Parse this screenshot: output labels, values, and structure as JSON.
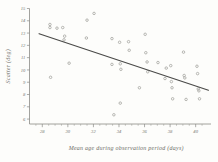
{
  "chart_data": {
    "type": "scatter",
    "title": "",
    "xlabel": "Mean age during observation period  (days)",
    "ylabel": "Scatter (deg)",
    "xlim": [
      27.0,
      41.2
    ],
    "ylim": [
      5.6,
      15.0
    ],
    "grid": false,
    "legend": null,
    "xticks": [
      28,
      30,
      32,
      34,
      36,
      38,
      40
    ],
    "xtick_labels": [
      "28",
      "30",
      "32",
      "34",
      "36",
      "38",
      "40"
    ],
    "yticks": [
      6,
      7,
      8,
      9,
      10,
      11,
      12,
      13,
      14,
      15
    ],
    "ytick_labels": [
      "6",
      "7",
      "8",
      "9",
      "10",
      "11",
      "12",
      "13",
      "14",
      "15"
    ],
    "x_minor_tick_step": 0.5,
    "marker": "open-circle",
    "marker_color": "#a9a9a4",
    "line_color": "#4a4a48",
    "points": [
      {
        "x": 28.6,
        "y": 13.7
      },
      {
        "x": 28.6,
        "y": 13.45
      },
      {
        "x": 29.15,
        "y": 13.4
      },
      {
        "x": 28.65,
        "y": 9.4
      },
      {
        "x": 29.6,
        "y": 13.45
      },
      {
        "x": 29.7,
        "y": 12.45
      },
      {
        "x": 29.75,
        "y": 12.75
      },
      {
        "x": 30.1,
        "y": 10.55
      },
      {
        "x": 31.45,
        "y": 12.6
      },
      {
        "x": 31.5,
        "y": 14.05
      },
      {
        "x": 32.05,
        "y": 14.6
      },
      {
        "x": 33.45,
        "y": 12.55
      },
      {
        "x": 33.45,
        "y": 10.45
      },
      {
        "x": 33.6,
        "y": 6.35
      },
      {
        "x": 34.05,
        "y": 12.25
      },
      {
        "x": 34.1,
        "y": 10.5
      },
      {
        "x": 34.15,
        "y": 10.05
      },
      {
        "x": 34.1,
        "y": 7.3
      },
      {
        "x": 34.75,
        "y": 12.3
      },
      {
        "x": 34.8,
        "y": 11.6
      },
      {
        "x": 35.6,
        "y": 8.55
      },
      {
        "x": 36.05,
        "y": 12.9
      },
      {
        "x": 36.1,
        "y": 11.4
      },
      {
        "x": 36.2,
        "y": 10.65
      },
      {
        "x": 36.25,
        "y": 9.85
      },
      {
        "x": 37.05,
        "y": 10.6
      },
      {
        "x": 37.6,
        "y": 9.3
      },
      {
        "x": 37.7,
        "y": 10.15
      },
      {
        "x": 38.05,
        "y": 10.35
      },
      {
        "x": 38.1,
        "y": 9.05
      },
      {
        "x": 38.15,
        "y": 8.55
      },
      {
        "x": 38.2,
        "y": 7.65
      },
      {
        "x": 39.05,
        "y": 11.45
      },
      {
        "x": 39.1,
        "y": 9.55
      },
      {
        "x": 39.15,
        "y": 9.35
      },
      {
        "x": 39.25,
        "y": 7.6
      },
      {
        "x": 40.1,
        "y": 10.3
      },
      {
        "x": 40.15,
        "y": 9.7
      },
      {
        "x": 40.2,
        "y": 8.45
      },
      {
        "x": 40.25,
        "y": 8.3
      },
      {
        "x": 40.3,
        "y": 7.65
      }
    ],
    "trend_line": {
      "x_start": 27.75,
      "y_start": 12.95,
      "x_end": 41.0,
      "y_end": 8.35
    }
  }
}
